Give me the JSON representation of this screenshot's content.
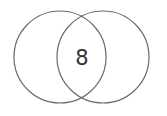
{
  "diagram": {
    "type": "venn",
    "sets": [
      {
        "name": "left-set",
        "cx": 60,
        "cy": 57,
        "r": 46
      },
      {
        "name": "right-set",
        "cx": 103,
        "cy": 57,
        "r": 46
      }
    ],
    "intersection_label": "8",
    "stroke_color": "#6b6b6b",
    "text_color": "#333333"
  }
}
